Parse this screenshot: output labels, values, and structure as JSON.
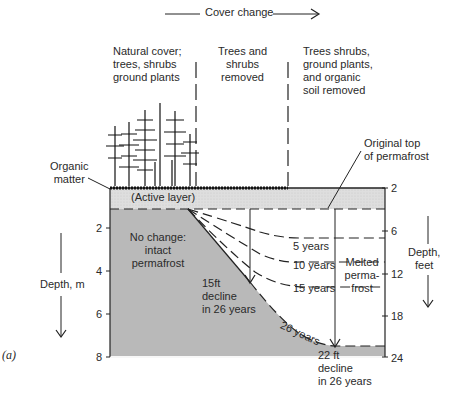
{
  "header": {
    "cover_change": "Cover change"
  },
  "columns": [
    {
      "label": "Natural cover;\ntrees, shrubs\nground plants"
    },
    {
      "label": "Trees and\nshrubs\nremoved"
    },
    {
      "label": "Trees shrubs,\nground plants,\nand organic\nsoil removed"
    }
  ],
  "labels": {
    "organic_matter": "Organic\nmatter",
    "original_top": "Original top\nof permafrost",
    "active_layer": "(Active layer)",
    "no_change": "No change:\nintact\npermafrost",
    "melted": "Melted\nperma-\nfrost",
    "decline_15": "15ft\ndecline\nin 26 years",
    "decline_22": "22 ft\ndecline\nin 26 years",
    "years_5": "5 years",
    "years_10": "10 years",
    "years_15": "15 years",
    "years_26": "26 years",
    "panel": "(a)"
  },
  "axes": {
    "left": {
      "title": "Depth, m",
      "ticks": [
        "2",
        "4",
        "6",
        "8"
      ]
    },
    "right": {
      "title": "Depth,\nfeet",
      "ticks": [
        "2",
        "6",
        "12",
        "18",
        "24"
      ]
    }
  },
  "colors": {
    "permafrost": "#b8b8b8",
    "active_layer": "#dcdcdc",
    "line": "#222222"
  }
}
